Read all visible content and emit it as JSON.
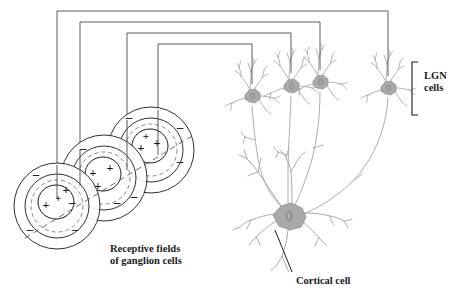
{
  "figure": {
    "type": "neuroscience-schematic",
    "title_labels": {
      "receptive_fields_line1": "Receptive fields",
      "receptive_fields_line2": "of ganglion cells",
      "cortical_cell": "Cortical cell",
      "lgn_line1": "LGN",
      "lgn_line2": "cells"
    },
    "colors": {
      "ink": "#1a1a1a",
      "wire": "#3a3a3a",
      "neuron_stroke": "#9a9a9a",
      "neuron_soma": "#a8a8a8",
      "background": "#ffffff"
    },
    "receptive_fields": [
      {
        "id": "rf-1",
        "cx": 57,
        "cy": 206,
        "outer_r": 43,
        "mid_r": 32,
        "dashed_r": 26,
        "center_r": 18,
        "plus_count": 3,
        "minus_count": 3,
        "plus_signs": [
          "+",
          "+",
          "+"
        ],
        "minus_signs": [
          "–",
          "–",
          "–"
        ]
      },
      {
        "id": "rf-2",
        "cx": 104,
        "cy": 178,
        "outer_r": 43,
        "mid_r": 32,
        "dashed_r": 26,
        "center_r": 18,
        "plus_count": 3,
        "minus_count": 3,
        "plus_signs": [
          "+",
          "+",
          "+"
        ],
        "minus_signs": [
          "–",
          "–",
          "–"
        ]
      },
      {
        "id": "rf-3",
        "cx": 151,
        "cy": 150,
        "outer_r": 43,
        "mid_r": 32,
        "dashed_r": 26,
        "center_r": 18,
        "plus_count": 3,
        "minus_count": 3,
        "plus_signs": [
          "+",
          "+",
          "+"
        ],
        "minus_signs": [
          "–",
          "–",
          "–"
        ]
      }
    ],
    "lgn_cells": [
      {
        "id": "lgn-1",
        "cx": 252,
        "cy": 96,
        "label": "lgn-neuron-1"
      },
      {
        "id": "lgn-2",
        "cx": 291,
        "cy": 86,
        "label": "lgn-neuron-2"
      },
      {
        "id": "lgn-3",
        "cx": 320,
        "cy": 82,
        "label": "lgn-neuron-3"
      },
      {
        "id": "lgn-4",
        "cx": 388,
        "cy": 88,
        "label": "lgn-neuron-4"
      }
    ],
    "cortical_cell": {
      "cx": 289,
      "cy": 217
    },
    "wires": [
      {
        "id": "wire-1",
        "from_x": 57,
        "top_y": 11,
        "to_x": 388,
        "drop_to": 76
      },
      {
        "id": "wire-2",
        "from_x": 80,
        "top_y": 22,
        "to_x": 320,
        "drop_to": 71
      },
      {
        "id": "wire-3",
        "from_x": 127,
        "top_y": 33,
        "to_x": 291,
        "drop_to": 74
      },
      {
        "id": "wire-4",
        "from_x": 158,
        "top_y": 44,
        "to_x": 252,
        "drop_to": 84
      }
    ],
    "lgn_bracket": {
      "x": 412,
      "y_top": 62,
      "y_bottom": 115,
      "tick": 6
    },
    "pointer_line": {
      "x1": 291,
      "y1": 273,
      "x2": 274,
      "y2": 229
    },
    "orientation_axis": {
      "x1": 27,
      "y1": 235,
      "x2": 190,
      "y2": 138,
      "dashed": true
    }
  }
}
